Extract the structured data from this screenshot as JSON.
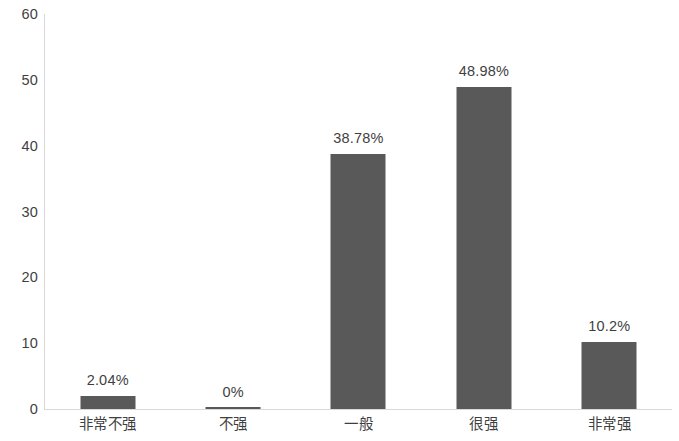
{
  "chart_data": {
    "type": "bar",
    "title": "",
    "subtitle": "",
    "xlabel": "",
    "ylabel": "",
    "ylim": [
      0,
      60
    ],
    "yticks": [
      "0",
      "10",
      "20",
      "30",
      "40",
      "50",
      "60"
    ],
    "ytick_values": [
      0,
      10,
      20,
      30,
      40,
      50,
      60
    ],
    "grid": false,
    "legend": false,
    "legend_position": "none",
    "bar_color": "#595959",
    "axis_color": "#d9d9d9",
    "label_color": "#3f3f3f",
    "categories": [
      "非常不强",
      "不强",
      "一般",
      "很强",
      "非常强"
    ],
    "values": [
      2.04,
      0,
      38.78,
      48.98,
      10.2
    ],
    "data_labels": [
      "2.04%",
      "0%",
      "38.78%",
      "48.98%",
      "10.2%"
    ]
  }
}
